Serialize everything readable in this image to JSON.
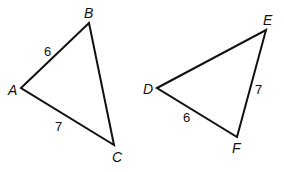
{
  "diagram": {
    "type": "geometry-triangles",
    "triangles": [
      {
        "name": "ABC",
        "vertices": {
          "A": {
            "label": "A",
            "x": 21,
            "y": 88
          },
          "B": {
            "label": "B",
            "x": 89,
            "y": 23
          },
          "C": {
            "label": "C",
            "x": 114,
            "y": 145
          }
        },
        "sides": {
          "AB": {
            "label": "6"
          },
          "AC": {
            "label": "7"
          }
        }
      },
      {
        "name": "DEF",
        "vertices": {
          "D": {
            "label": "D",
            "x": 157,
            "y": 88
          },
          "E": {
            "label": "E",
            "x": 266,
            "y": 30
          },
          "F": {
            "label": "F",
            "x": 237,
            "y": 137
          }
        },
        "sides": {
          "DF": {
            "label": "6"
          },
          "EF": {
            "label": "7"
          }
        }
      }
    ]
  }
}
